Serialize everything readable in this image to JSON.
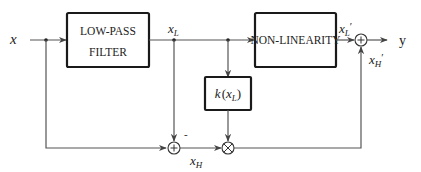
{
  "diagram": {
    "title": "",
    "inputs": {
      "x": "x"
    },
    "outputs": {
      "y": "y"
    },
    "blocks": {
      "lowpass": {
        "line1": "LOW-PASS",
        "line2": "FILTER"
      },
      "nonlinearity": {
        "label": "NON-LINEARITY"
      },
      "gain": {
        "func": "k",
        "open": "(",
        "var": "x",
        "sub": "L",
        "close": ")"
      }
    },
    "signals": {
      "xL": {
        "base": "x",
        "sub": "L"
      },
      "xLprime": {
        "base": "x",
        "sub": "L",
        "prime": "′"
      },
      "xH": {
        "base": "x",
        "sub": "H"
      },
      "xHprime": {
        "base": "x",
        "sub": "H",
        "prime": "′"
      }
    },
    "junctions": {
      "sum_top": {
        "symbol": "+"
      },
      "sum_bottom": {
        "symbol": "+",
        "minus_sign": "-"
      },
      "multiplier": {
        "symbol": "×"
      }
    },
    "colors": {
      "wire": "#555555",
      "box": "#1a1a1a",
      "text": "#222222",
      "background": "#ffffff"
    }
  }
}
